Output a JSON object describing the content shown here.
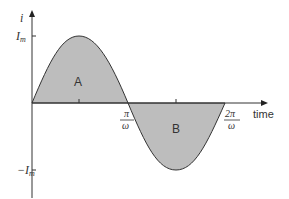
{
  "diagram": {
    "y_axis_label": "i",
    "x_axis_label": "time",
    "max_label": "I",
    "max_sub": "m",
    "min_label": "−I",
    "min_sub": "m",
    "half_period_num": "π",
    "half_period_den": "ω",
    "full_period_num": "2π",
    "full_period_den": "ω",
    "region_a": "A",
    "region_b": "B",
    "colors": {
      "fill": "#bdbdbd",
      "stroke": "#333333"
    }
  }
}
